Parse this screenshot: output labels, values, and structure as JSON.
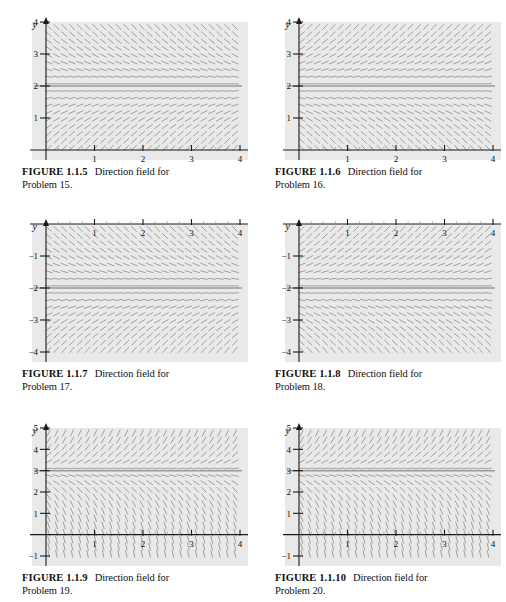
{
  "page": {
    "background": "#ffffff",
    "plot_background": "#e9e9e9",
    "segment_color": "#8d8d8d",
    "axis_color": "#1a1a1a",
    "equilibrium_color": "#9a9a9a"
  },
  "figures": [
    {
      "id": "figure-1-1-5",
      "caption_label": "FIGURE 1.1.5",
      "caption_text": "Direction field for",
      "caption_line2": "Problem 15.",
      "axis": {
        "x_label": "t",
        "y_label": "y",
        "x_ticks": [
          "1",
          "2",
          "3",
          "4"
        ],
        "y_ticks": [
          "1",
          "2",
          "3",
          "4"
        ],
        "xlim": [
          0,
          4
        ],
        "ylim": [
          0,
          4
        ]
      },
      "chart_data": {
        "type": "slope-field",
        "title": "Direction field for Problem 15",
        "xlabel": "t",
        "ylabel": "y",
        "xlim": [
          0,
          4
        ],
        "ylim": [
          0,
          4
        ],
        "equilibrium": [
          2
        ],
        "stability": "unstable",
        "grid": false,
        "legend": "none"
      }
    },
    {
      "id": "figure-1-1-6",
      "caption_label": "FIGURE 1.1.6",
      "caption_text": "Direction field for",
      "caption_line2": "Problem 16.",
      "axis": {
        "x_label": "t",
        "y_label": "y",
        "x_ticks": [
          "1",
          "2",
          "3",
          "4"
        ],
        "y_ticks": [
          "1",
          "2",
          "3",
          "4"
        ],
        "xlim": [
          0,
          4
        ],
        "ylim": [
          0,
          4
        ]
      },
      "chart_data": {
        "type": "slope-field",
        "title": "Direction field for Problem 16",
        "xlabel": "t",
        "ylabel": "y",
        "xlim": [
          0,
          4
        ],
        "ylim": [
          0,
          4
        ],
        "equilibrium": [
          2
        ],
        "stability": "unstable-up",
        "grid": false,
        "legend": "none"
      }
    },
    {
      "id": "figure-1-1-7",
      "caption_label": "FIGURE 1.1.7",
      "caption_text": "Direction field for",
      "caption_line2": "Problem 17.",
      "axis": {
        "x_label": "t",
        "y_label": "y",
        "x_ticks": [
          "1",
          "2",
          "3",
          "4"
        ],
        "y_ticks": [
          "−1",
          "−2",
          "−3",
          "−4"
        ],
        "xlim": [
          0,
          4
        ],
        "ylim": [
          -4,
          0
        ]
      },
      "chart_data": {
        "type": "slope-field",
        "title": "Direction field for Problem 17",
        "xlabel": "t",
        "ylabel": "y",
        "xlim": [
          0,
          4
        ],
        "ylim": [
          -4,
          0
        ],
        "equilibrium": [
          -2
        ],
        "stability": "unstable",
        "grid": false,
        "legend": "none"
      }
    },
    {
      "id": "figure-1-1-8",
      "caption_label": "FIGURE 1.1.8",
      "caption_text": "Direction field for",
      "caption_line2": "Problem 18.",
      "axis": {
        "x_label": "t",
        "y_label": "y",
        "x_ticks": [
          "1",
          "2",
          "3",
          "4"
        ],
        "y_ticks": [
          "−1",
          "−2",
          "−3",
          "−4"
        ],
        "xlim": [
          0,
          4
        ],
        "ylim": [
          -4,
          0
        ]
      },
      "chart_data": {
        "type": "slope-field",
        "title": "Direction field for Problem 18",
        "xlabel": "t",
        "ylabel": "y",
        "xlim": [
          0,
          4
        ],
        "ylim": [
          -4,
          0
        ],
        "equilibrium": [
          -2
        ],
        "stability": "unstable-up",
        "grid": false,
        "legend": "none"
      }
    },
    {
      "id": "figure-1-1-9",
      "caption_label": "FIGURE 1.1.9",
      "caption_text": "Direction field for",
      "caption_line2": "Problem 19.",
      "axis": {
        "x_label": "t",
        "y_label": "y",
        "x_ticks": [
          "1",
          "2",
          "3",
          "4"
        ],
        "y_ticks": [
          "−1",
          "1",
          "2",
          "3",
          "4",
          "5"
        ],
        "xlim": [
          0,
          4
        ],
        "ylim": [
          -1,
          5
        ]
      },
      "chart_data": {
        "type": "slope-field",
        "title": "Direction field for Problem 19",
        "xlabel": "t",
        "ylabel": "y",
        "xlim": [
          0,
          4
        ],
        "ylim": [
          -1,
          5
        ],
        "equilibrium": [
          3
        ],
        "stability": "steep-unstable",
        "grid": false,
        "legend": "none"
      }
    },
    {
      "id": "figure-1-1-10",
      "caption_label": "FIGURE 1.1.10",
      "caption_text": "Direction field for",
      "caption_line2": "Problem 20.",
      "axis": {
        "x_label": "t",
        "y_label": "y",
        "x_ticks": [
          "1",
          "2",
          "3",
          "4"
        ],
        "y_ticks": [
          "−1",
          "1",
          "2",
          "3",
          "4",
          "5"
        ],
        "xlim": [
          0,
          4
        ],
        "ylim": [
          -1,
          5
        ]
      },
      "chart_data": {
        "type": "slope-field",
        "title": "Direction field for Problem 20",
        "xlabel": "t",
        "ylabel": "y",
        "xlim": [
          0,
          4
        ],
        "ylim": [
          -1,
          5
        ],
        "equilibrium": [
          3
        ],
        "stability": "steep-unstable",
        "grid": false,
        "legend": "none"
      }
    }
  ]
}
